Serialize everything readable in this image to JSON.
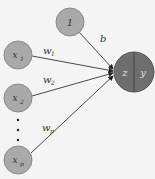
{
  "diagram": {
    "type": "perceptron",
    "bias_node": {
      "label": "1",
      "edge_label": "b"
    },
    "inputs": [
      {
        "label": "x",
        "sub": "1",
        "weight": "w",
        "wsub": "1"
      },
      {
        "label": "x",
        "sub": "2",
        "weight": "w",
        "wsub": "2"
      },
      {
        "label": "x",
        "sub": "p",
        "weight": "w",
        "wsub": "p"
      }
    ],
    "output": {
      "left_label": "z",
      "right_label": "y"
    },
    "colors": {
      "input_fill": "#a9a9a9",
      "output_fill": "#6e6e6e",
      "edge": "#333333",
      "bg": "#f4f4f4"
    }
  }
}
